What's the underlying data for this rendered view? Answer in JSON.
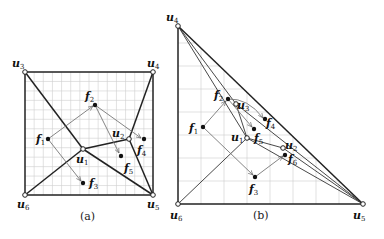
{
  "panels": [
    {
      "caption": "(a)",
      "vertices": [
        {
          "name": "u",
          "sub": "1",
          "x": 83,
          "y": 149,
          "lx": 76,
          "ly": 163
        },
        {
          "name": "u",
          "sub": "2",
          "x": 129,
          "y": 139,
          "lx": 112,
          "ly": 137
        },
        {
          "name": "u",
          "sub": "3",
          "x": 25,
          "y": 72,
          "lx": 12,
          "ly": 67
        },
        {
          "name": "u",
          "sub": "4",
          "x": 153,
          "y": 72,
          "lx": 147,
          "ly": 67
        },
        {
          "name": "u",
          "sub": "5",
          "x": 153,
          "y": 195,
          "lx": 147,
          "ly": 208
        },
        {
          "name": "u",
          "sub": "6",
          "x": 25,
          "y": 195,
          "lx": 17,
          "ly": 208
        }
      ],
      "faces": [
        {
          "name": "f",
          "sub": "1",
          "x": 48,
          "y": 139,
          "lx": 36,
          "ly": 143
        },
        {
          "name": "f",
          "sub": "2",
          "x": 95,
          "y": 105,
          "lx": 85,
          "ly": 100
        },
        {
          "name": "f",
          "sub": "3",
          "x": 83,
          "y": 183,
          "lx": 89,
          "ly": 187
        },
        {
          "name": "f",
          "sub": "4",
          "x": 144,
          "y": 139,
          "lx": 137,
          "ly": 154
        },
        {
          "name": "f",
          "sub": "5",
          "x": 121,
          "y": 156,
          "lx": 124,
          "ly": 172
        }
      ],
      "color_edges": "#222222",
      "color_arrows": "#777777",
      "color_grid": "#cccccc"
    },
    {
      "caption": "(b)",
      "vertices": [
        {
          "name": "u",
          "sub": "1",
          "x": 247,
          "y": 138,
          "lx": 231,
          "ly": 141
        },
        {
          "name": "u",
          "sub": "2",
          "x": 283,
          "y": 148,
          "lx": 285,
          "ly": 149
        },
        {
          "name": "u",
          "sub": "3",
          "x": 236,
          "y": 104,
          "lx": 237,
          "ly": 109
        },
        {
          "name": "u",
          "sub": "4",
          "x": 178,
          "y": 26,
          "lx": 166,
          "ly": 21
        },
        {
          "name": "u",
          "sub": "5",
          "x": 363,
          "y": 204,
          "lx": 353,
          "ly": 219
        },
        {
          "name": "u",
          "sub": "6",
          "x": 178,
          "y": 204,
          "lx": 170,
          "ly": 219
        }
      ],
      "faces": [
        {
          "name": "f",
          "sub": "1",
          "x": 203,
          "y": 127,
          "lx": 189,
          "ly": 132
        },
        {
          "name": "f",
          "sub": "2",
          "x": 228,
          "y": 99,
          "lx": 214,
          "ly": 99
        },
        {
          "name": "f",
          "sub": "3",
          "x": 255,
          "y": 177,
          "lx": 249,
          "ly": 193
        },
        {
          "name": "f",
          "sub": "4",
          "x": 265,
          "y": 119,
          "lx": 266,
          "ly": 127
        },
        {
          "name": "f",
          "sub": "5",
          "x": 254,
          "y": 129,
          "lx": 254,
          "ly": 142
        },
        {
          "name": "f",
          "sub": "6",
          "x": 285,
          "y": 155,
          "lx": 288,
          "ly": 163
        }
      ]
    }
  ]
}
